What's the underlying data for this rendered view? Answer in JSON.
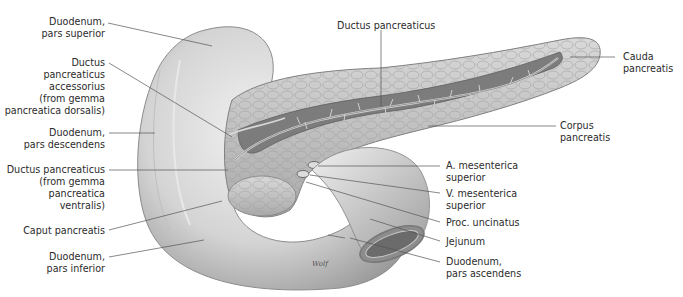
{
  "figure": {
    "signature": "Wolf"
  },
  "labels": {
    "duodenum_superior": {
      "lines": [
        "Duodenum,",
        "pars superior"
      ]
    },
    "ductus_accessorius": {
      "lines": [
        "Ductus",
        "pancreaticus",
        "accessorius",
        "(from gemma",
        "pancreatica dorsalis)"
      ]
    },
    "duodenum_descendens": {
      "lines": [
        "Duodenum,",
        "pars descendens"
      ]
    },
    "ductus_ventralis": {
      "lines": [
        "Ductus pancreaticus",
        "(from gemma",
        "pancreatica",
        "ventralis)"
      ]
    },
    "caput": {
      "lines": [
        "Caput pancreatis"
      ]
    },
    "duodenum_inferior": {
      "lines": [
        "Duodenum,",
        "pars inferior"
      ]
    },
    "ductus_pancreaticus": {
      "lines": [
        "Ductus pancreaticus"
      ]
    },
    "cauda": {
      "lines": [
        "Cauda",
        "pancreatis"
      ]
    },
    "corpus": {
      "lines": [
        "Corpus",
        "pancreatis"
      ]
    },
    "a_mesenterica": {
      "lines": [
        "A. mesenterica",
        "superior"
      ]
    },
    "v_mesenterica": {
      "lines": [
        "V. mesenterica",
        "superior"
      ]
    },
    "proc_uncinatus": {
      "lines": [
        "Proc. uncinatus"
      ]
    },
    "jejunum": {
      "lines": [
        "Jejunum"
      ]
    },
    "duodenum_ascendens": {
      "lines": [
        "Duodenum,",
        "pars ascendens"
      ]
    }
  },
  "colors": {
    "background": "#ffffff",
    "text": "#2b2b2b",
    "leader": "#555555",
    "gland": "#bdbdbd",
    "gland_dark": "#8a8a8a",
    "duct_bed": "#7c7c7c",
    "duodenum": "#d6d6d6"
  }
}
